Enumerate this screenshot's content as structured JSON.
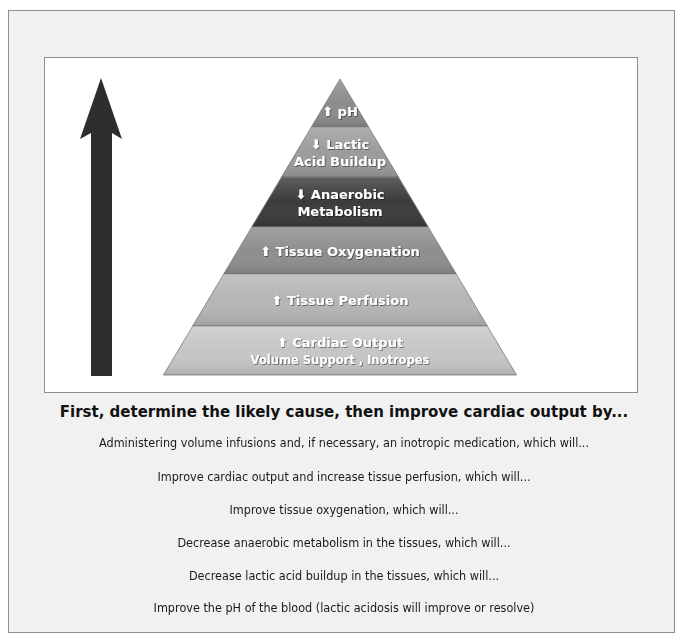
{
  "pyramid": {
    "tiers": [
      {
        "direction": "up",
        "icon": "arrow-up-icon",
        "lines": [
          "pH"
        ],
        "color": "#8c8c8c"
      },
      {
        "direction": "down",
        "icon": "arrow-down-icon",
        "lines": [
          "Lactic",
          "Acid Buildup"
        ],
        "color": "#9c9c9c"
      },
      {
        "direction": "down",
        "icon": "arrow-down-icon",
        "lines": [
          "Anaerobic",
          "Metabolism"
        ],
        "color": "#3b3b3b"
      },
      {
        "direction": "up",
        "icon": "arrow-up-icon",
        "lines": [
          "Tissue Oxygenation"
        ],
        "color": "#8e8e8e"
      },
      {
        "direction": "up",
        "icon": "arrow-up-icon",
        "lines": [
          "Tissue Perfusion"
        ],
        "color": "#b5b5b5"
      },
      {
        "direction": "up",
        "icon": "arrow-up-icon",
        "lines": [
          "Cardiac Output",
          "Volume Support , Inotropes"
        ],
        "color": "#c6c6c6"
      }
    ],
    "side_arrow": {
      "icon": "large-up-arrow-icon",
      "color": "#2e2e2e"
    }
  },
  "caption": {
    "heading": "First, determine the likely cause, then improve cardiac output by...",
    "steps": [
      "Administering volume infusions and, if necessary, an inotropic medication, which will...",
      "Improve cardiac output and increase tissue perfusion, which will...",
      "Improve tissue oxygenation, which will...",
      "Decrease anaerobic metabolism in the tissues, which will...",
      "Decrease lactic acid buildup in the tissues, which will...",
      "Improve the pH of the blood (lactic acidosis will improve or resolve)"
    ]
  },
  "colors": {
    "background": "#f1f1f1",
    "panel": "#ffffff",
    "border": "#8f8f8f",
    "text": "#1a1a1a"
  }
}
